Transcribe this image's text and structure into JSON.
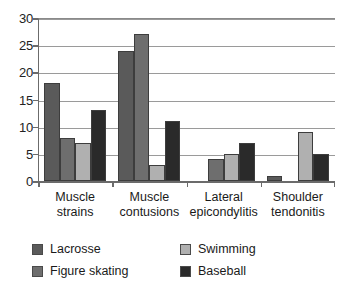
{
  "chart_data": {
    "type": "bar",
    "title": "",
    "subtitle": "",
    "xlabel": "",
    "ylabel": "",
    "ylim": [
      0,
      30
    ],
    "yticks": [
      0,
      5,
      10,
      15,
      20,
      25,
      30
    ],
    "ytick_labels": [
      "0",
      "5",
      "10",
      "15",
      "20",
      "25",
      "30"
    ],
    "grid": true,
    "grid_axis": "y",
    "legend_position": "bottom-left",
    "categories": [
      "Muscle strains",
      "Muscle contusions",
      "Lateral epicondylitis",
      "Shoulder tendonitis"
    ],
    "category_lines": [
      {
        "line1": "Muscle",
        "line2": "strains"
      },
      {
        "line1": "Muscle",
        "line2": "contusions"
      },
      {
        "line1": "Lateral",
        "line2": "epicondylitis"
      },
      {
        "line1": "Shoulder",
        "line2": "tendonitis"
      }
    ],
    "series": [
      {
        "name": "Lacrosse",
        "color": "#5a5a5a",
        "values": [
          18,
          24,
          0,
          1
        ]
      },
      {
        "name": "Figure skating",
        "color": "#6e6e6e",
        "values": [
          8,
          27,
          4,
          0
        ]
      },
      {
        "name": "Swimming",
        "color": "#b0b0b0",
        "values": [
          7,
          3,
          5,
          9
        ]
      },
      {
        "name": "Baseball",
        "color": "#2a2a2a",
        "values": [
          13,
          11,
          7,
          5
        ]
      }
    ]
  },
  "legend": {
    "entries": [
      {
        "label": "Lacrosse",
        "color": "#5a5a5a"
      },
      {
        "label": "Swimming",
        "color": "#b0b0b0"
      },
      {
        "label": "Figure skating",
        "color": "#6e6e6e"
      },
      {
        "label": "Baseball",
        "color": "#2a2a2a"
      }
    ]
  },
  "colors": {
    "axis": "#6b6b6b",
    "gridline": "#9a9a9a",
    "bar_outline": "#3d3d3d",
    "background": "#ffffff",
    "text": "#1a1a1a"
  }
}
